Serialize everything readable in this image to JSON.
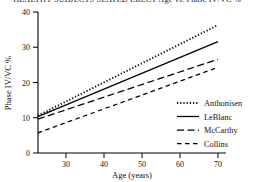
{
  "chart_data": {
    "type": "line",
    "title": "HEALTHY SUBJECTS SEATED ERECT  Age vs. Phase IV/VC %",
    "xlabel": "Age (years)",
    "ylabel": "Phase IV/VC %",
    "xlim": [
      22.6,
      70
    ],
    "ylim": [
      0,
      40
    ],
    "xticks": [
      30,
      40,
      50,
      60,
      70
    ],
    "xtick_labels": [
      "30",
      "40",
      "50",
      "60",
      "70"
    ],
    "yticks": [
      0,
      10,
      20,
      30,
      40
    ],
    "ytick_labels": [
      "0",
      "10",
      "20",
      "30",
      "40"
    ],
    "grid": false,
    "legend_position": "center-right",
    "series": [
      {
        "name": "Anthonisen",
        "style": "dotted",
        "x": [
          22.6,
          70
        ],
        "values": [
          10.6,
          36.3
        ]
      },
      {
        "name": "LeBlanc",
        "style": "solid",
        "x": [
          22.6,
          70
        ],
        "values": [
          10.3,
          31.6
        ]
      },
      {
        "name": "McCarthy",
        "style": "long-dash",
        "x": [
          22.6,
          70
        ],
        "values": [
          9.6,
          26.6
        ]
      },
      {
        "name": "Collins",
        "style": "dashed",
        "x": [
          22.6,
          70
        ],
        "values": [
          5.7,
          24.3
        ]
      }
    ]
  },
  "legend": {
    "items": [
      {
        "label": "Anthonisen",
        "swatch": "dotted-line-swatch"
      },
      {
        "label": "LeBlanc",
        "swatch": "solid-line-swatch"
      },
      {
        "label": "McCarthy",
        "swatch": "long-dash-line-swatch"
      },
      {
        "label": "Collins",
        "swatch": "dashed-line-swatch"
      }
    ]
  },
  "colors": {
    "ink": "#000000",
    "background": "#ffffff"
  }
}
